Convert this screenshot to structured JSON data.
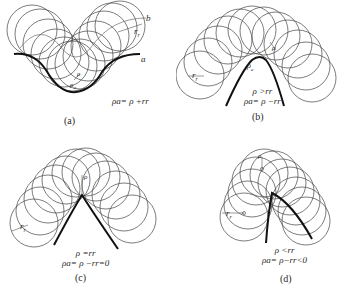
{
  "figure": {
    "panels": [
      {
        "id": "a",
        "caption": "(a)",
        "labels": {
          "curve_b": "b",
          "curve_a": "a",
          "roller_radius": "r",
          "roller_sub": "r",
          "rho": "ρ",
          "rho_a": "ρ",
          "rho_a_sub": "a"
        },
        "formula_lines": [
          "ρa= ρ +rr"
        ]
      },
      {
        "id": "b",
        "caption": "(b)",
        "labels": {
          "roller_radius": "r",
          "roller_sub": "r",
          "rho": "ρ",
          "rho_a": "ρ",
          "rho_a_sub": "a"
        },
        "formula_lines": [
          "ρ >rr",
          "ρa= ρ −rr"
        ]
      },
      {
        "id": "c",
        "caption": "(c)",
        "labels": {
          "roller_radius": "r",
          "roller_sub": "r",
          "rho": "ρ"
        },
        "formula_lines": [
          "ρ =rr",
          "ρa= ρ −rr=0"
        ]
      },
      {
        "id": "d",
        "caption": "(d)",
        "labels": {
          "roller_radius": "r",
          "roller_sub": "r",
          "rho": "ρ"
        },
        "formula_lines": [
          "ρ <rr",
          "ρa= ρ−rr<0"
        ]
      }
    ]
  }
}
